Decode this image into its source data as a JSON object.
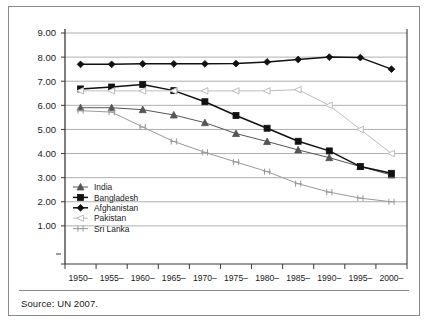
{
  "figure": {
    "source_note": "Source: UN 2007."
  },
  "chart_data": {
    "type": "line",
    "title": "",
    "xlabel": "",
    "ylabel": "",
    "ylim": [
      0,
      9
    ],
    "yticks": [
      "1.00",
      "2.00",
      "3.00",
      "4.00",
      "5.00",
      "6.00",
      "7.00",
      "8.00",
      "9.00"
    ],
    "grid": true,
    "legend_position": "bottom-left",
    "categories": [
      "1950–\n1955",
      "1955–\n1960",
      "1960–\n1965",
      "1965–\n1970",
      "1970–\n1975",
      "1975–\n1980",
      "1980–\n1985",
      "1985–\n1990",
      "1990–\n1995",
      "1995–\n2000",
      "2000–\n2005"
    ],
    "categories_line1": [
      "1950–",
      "1955–",
      "1960–",
      "1965–",
      "1970–",
      "1975–",
      "1980–",
      "1985–",
      "1990–",
      "1995–",
      "2000–"
    ],
    "categories_line2": [
      "1955",
      "1960",
      "1965",
      "1970",
      "1975",
      "1980",
      "1985",
      "1990",
      "1995",
      "2000",
      "2005"
    ],
    "series": [
      {
        "name": "India",
        "marker": "triangle",
        "color": "#555555",
        "values": [
          5.9,
          5.9,
          5.82,
          5.6,
          5.28,
          4.83,
          4.5,
          4.15,
          3.83,
          3.46,
          3.11
        ]
      },
      {
        "name": "Bangladesh",
        "marker": "square",
        "color": "#111111",
        "values": [
          6.68,
          6.76,
          6.86,
          6.61,
          6.15,
          5.58,
          5.05,
          4.51,
          4.11,
          3.46,
          3.18
        ]
      },
      {
        "name": "Afghanistan",
        "marker": "diamond",
        "color": "#111111",
        "values": [
          7.7,
          7.7,
          7.72,
          7.72,
          7.72,
          7.73,
          7.8,
          7.9,
          8.0,
          7.98,
          7.5
        ]
      },
      {
        "name": "Pakistan",
        "marker": "open-triangle",
        "color": "#bdbdbd",
        "values": [
          6.6,
          6.6,
          6.6,
          6.6,
          6.6,
          6.6,
          6.6,
          6.65,
          6.0,
          5.0,
          4.0
        ]
      },
      {
        "name": "Sri Lanka",
        "marker": "asterisk",
        "color": "#9a9a9a",
        "values": [
          5.78,
          5.72,
          5.1,
          4.5,
          4.05,
          3.65,
          3.25,
          2.75,
          2.4,
          2.15,
          2.0
        ]
      }
    ]
  }
}
